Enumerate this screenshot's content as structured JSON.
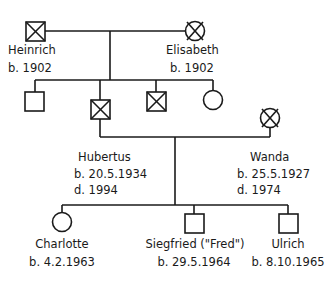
{
  "diagram": {
    "type": "pedigree-chart",
    "colors": {
      "line": "#1a1a1a",
      "background": "#ffffff"
    },
    "legend_symbols": {
      "square": "male",
      "circle": "female",
      "crossed": "deceased"
    },
    "generation1": {
      "heinrich": {
        "name": "Heinrich",
        "born": "b. 1902",
        "sex": "male",
        "deceased": true
      },
      "elisabeth": {
        "name": "Elisabeth",
        "born": "b. 1902",
        "sex": "female",
        "deceased": true
      }
    },
    "generation2": {
      "sibling1": {
        "sex": "male",
        "deceased": false
      },
      "hubertus": {
        "name": "Hubertus",
        "born": "b. 20.5.1934",
        "died": "d. 1994",
        "sex": "male",
        "deceased": true
      },
      "sibling3": {
        "sex": "male",
        "deceased": true
      },
      "sibling4": {
        "sex": "female",
        "deceased": false
      },
      "wanda": {
        "name": "Wanda",
        "born": "b. 25.5.1927",
        "died": "d. 1974",
        "sex": "female",
        "deceased": true
      }
    },
    "generation3": {
      "charlotte": {
        "name": "Charlotte",
        "born": "b. 4.2.1963",
        "sex": "female",
        "deceased": false
      },
      "siegfried": {
        "name": "Siegfried (\"Fred\")",
        "born": "b. 29.5.1964",
        "sex": "male",
        "deceased": false
      },
      "ulrich": {
        "name": "Ulrich",
        "born": "b. 8.10.1965",
        "sex": "male",
        "deceased": false
      }
    }
  }
}
